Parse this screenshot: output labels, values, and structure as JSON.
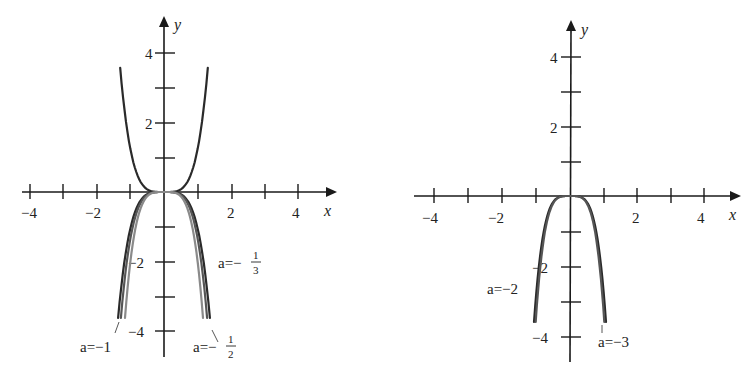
{
  "chart_data": [
    {
      "type": "line",
      "title": "",
      "xlabel": "x",
      "ylabel": "y",
      "xlim": [
        -4.3,
        5.1
      ],
      "ylim": [
        -4.8,
        5
      ],
      "x_ticks": [
        -4,
        -3,
        -2,
        -1,
        1,
        2,
        3,
        4
      ],
      "x_tick_labels": {
        "-4": "−4",
        "-2": "−2",
        "2": "2",
        "4": "4"
      },
      "y_ticks": [
        -4,
        -3,
        -2,
        -1,
        1,
        2,
        3,
        4
      ],
      "y_tick_labels": {
        "-4": "−4",
        "-2": "−2",
        "2": "2",
        "4": "4"
      },
      "grid": false,
      "series": [
        {
          "name": "upper",
          "label": "",
          "color": "#2a2a2a",
          "xmax": 1.27,
          "ymax": 3.6,
          "sign": 1
        },
        {
          "name": "a=-1/3",
          "label": "a=−",
          "frac": [
            "1",
            "3"
          ],
          "color": "#2a2a2a",
          "xmax": 1.33,
          "ymax": 3.65,
          "sign": -1
        },
        {
          "name": "a=-1/2",
          "label": "a=−",
          "frac": [
            "1",
            "2"
          ],
          "color": "#555555",
          "xmax": 1.25,
          "ymax": 3.65,
          "sign": -1
        },
        {
          "name": "a=-1",
          "label": "a=−1",
          "color": "#8a8a8a",
          "xmax": 1.13,
          "ymax": 3.65,
          "sign": -1
        }
      ]
    },
    {
      "type": "line",
      "title": "",
      "xlabel": "x",
      "ylabel": "y",
      "xlim": [
        -4.5,
        5.0
      ],
      "ylim": [
        -4.8,
        5
      ],
      "x_ticks": [
        -4,
        -3,
        -2,
        -1,
        1,
        2,
        3,
        4
      ],
      "x_tick_labels": {
        "-4": "−4",
        "-2": "−2",
        "2": "2",
        "4": "4"
      },
      "y_ticks": [
        -4,
        -3,
        -2,
        -1,
        1,
        2,
        3,
        4
      ],
      "y_tick_labels": {
        "-4": "−4",
        "-2": "−2",
        "2": "2",
        "4": "4"
      },
      "grid": false,
      "series": [
        {
          "name": "a=-2",
          "label": "a=−2",
          "color": "#2a2a2a",
          "xmax": 1.03,
          "ymax": 3.6,
          "sign": -1
        },
        {
          "name": "a=-3",
          "label": "a=−3",
          "color": "#555555",
          "xmax": 0.98,
          "ymax": 3.6,
          "sign": -1
        }
      ]
    }
  ],
  "labels": {
    "x": "x",
    "y": "y",
    "t4": "4",
    "t2": "2",
    "tm2": "−2",
    "tm4": "−4",
    "a13": "a=−",
    "a12": "a=−",
    "a1": "a=−1",
    "a2": "a=−2",
    "a3": "a=−3",
    "one": "1",
    "three": "3",
    "two": "2"
  }
}
